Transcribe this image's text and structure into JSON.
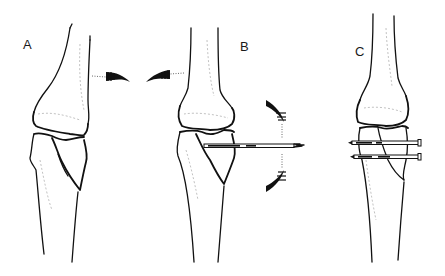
{
  "figure": {
    "colors": {
      "ink": "#111111",
      "background": "#ffffff",
      "faint": "#999999"
    },
    "panels": [
      {
        "id": "A",
        "label": "A",
        "content": "Knee with displaced lateral tibial plateau fracture; rotation arrows indicating varus/valgus stress"
      },
      {
        "id": "B",
        "label": "B",
        "content": "Knee with single transverse pin inserted through fractured plateau; curved arrows indicating manipulation"
      },
      {
        "id": "C",
        "label": "C",
        "content": "Knee with two parallel transverse pins fixing the reduced tibial plateau fracture"
      }
    ]
  }
}
